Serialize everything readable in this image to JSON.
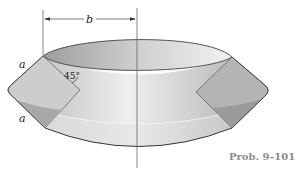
{
  "figure": {
    "caption": "Prob. 9–101",
    "labels": {
      "b": "b",
      "a_top": "a",
      "a_bottom": "a",
      "angle": "45°"
    },
    "colors": {
      "outline": "#444444",
      "band_light": "#e6e6e6",
      "band_mid": "#cfcfcf",
      "band_dark": "#a9a9a9",
      "inner_top": "#bdbdbd",
      "caption": "#8a8a8a"
    }
  }
}
